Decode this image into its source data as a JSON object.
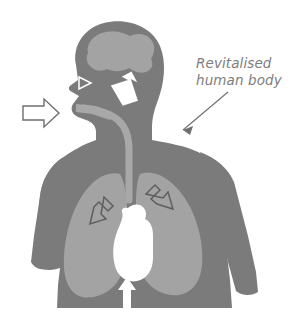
{
  "figure": {
    "background_color": "#ffffff",
    "annotation": {
      "label": "Revitalised\nhuman body",
      "line1": "Revitalised",
      "line2": "human body",
      "text_color": "#7d7d7d",
      "style": "italic",
      "leader_line_color": "#6e6e6e"
    },
    "colors": {
      "body_silhouette": "#7b7b7b",
      "organ_light": "#a3a3a3",
      "brain": "#a3a3a3",
      "lung": "#a3a3a3",
      "trachea": "#a8a8a8",
      "heart": "#ffffff",
      "solid_arrow": "#ffffff",
      "outline_arrow_fill": "#ffffff",
      "outline_arrow_stroke": "#6e6e6e",
      "inner_outline_arrow_stroke": "#5f5f5f"
    },
    "parts": [
      {
        "name": "head",
        "color": "#7b7b7b"
      },
      {
        "name": "brain",
        "color": "#a3a3a3"
      },
      {
        "name": "neck",
        "color": "#7b7b7b"
      },
      {
        "name": "torso",
        "color": "#7b7b7b"
      },
      {
        "name": "left-arm",
        "color": "#7b7b7b"
      },
      {
        "name": "right-arm",
        "color": "#7b7b7b"
      },
      {
        "name": "trachea",
        "color": "#a8a8a8"
      },
      {
        "name": "left-lung",
        "color": "#a3a3a3"
      },
      {
        "name": "right-lung",
        "color": "#a3a3a3"
      },
      {
        "name": "heart",
        "color": "#ffffff"
      }
    ],
    "arrows": [
      {
        "name": "inhale-mouth-arrow",
        "direction": "right",
        "style": "outlined",
        "position": "left of face"
      },
      {
        "name": "nose-arrow",
        "direction": "right",
        "style": "outlined-triangle",
        "position": "nose"
      },
      {
        "name": "brain-arrow",
        "direction": "up-left",
        "style": "solid-white",
        "position": "head interior"
      },
      {
        "name": "left-lung-arrow",
        "direction": "down-left",
        "style": "outlined",
        "position": "left lung"
      },
      {
        "name": "right-lung-arrow",
        "direction": "down-right",
        "style": "outlined",
        "position": "right lung"
      },
      {
        "name": "heart-arrow",
        "direction": "up",
        "style": "solid-white",
        "position": "below heart"
      }
    ]
  }
}
